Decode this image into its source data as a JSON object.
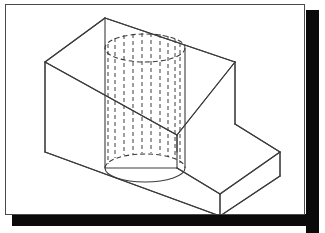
{
  "document": {
    "title": "Isometric stepped block with through hole",
    "figure_type": "engineering-isometric-drawing",
    "background_color": "#ffffff",
    "line_color": "#3c3c3c",
    "shadow_color": "#0a0a0a",
    "frame_border_color": "#4a4a4a"
  },
  "frame": {
    "x": 5,
    "y": 4,
    "width": 300,
    "height": 211,
    "shadow_offset": 13
  },
  "geometry": {
    "description": "Isometric projection of an L-shaped (stepped) rectangular block with a vertical cylindrical through hole. The cylinder is drawn with dashed hidden-line elements and solid visible silhouette edges.",
    "projection": "isometric",
    "solid_edges": [
      {
        "name": "top-face-back-left",
        "x1": 100,
        "y1": 14,
        "x2": 40,
        "y2": 58
      },
      {
        "name": "top-face-back-right",
        "x1": 100,
        "y1": 14,
        "x2": 230,
        "y2": 58
      },
      {
        "name": "top-face-front-left",
        "x1": 40,
        "y1": 58,
        "x2": 172,
        "y2": 131
      },
      {
        "name": "top-face-front-right",
        "x1": 230,
        "y1": 58,
        "x2": 172,
        "y2": 131
      },
      {
        "name": "left-vertical-edge",
        "x1": 40,
        "y1": 58,
        "x2": 40,
        "y2": 148
      },
      {
        "name": "right-vertical-edge",
        "x1": 230,
        "y1": 58,
        "x2": 230,
        "y2": 120
      },
      {
        "name": "front-vertical-edge",
        "x1": 172,
        "y1": 131,
        "x2": 172,
        "y2": 148
      },
      {
        "name": "step-top-right",
        "x1": 230,
        "y1": 120,
        "x2": 275,
        "y2": 148
      },
      {
        "name": "step-top-front",
        "x1": 275,
        "y1": 148,
        "x2": 215,
        "y2": 190
      },
      {
        "name": "step-top-left",
        "x1": 215,
        "y1": 190,
        "x2": 172,
        "y2": 164
      },
      {
        "name": "step-right-vertical",
        "x1": 275,
        "y1": 148,
        "x2": 275,
        "y2": 172
      },
      {
        "name": "step-front-vertical",
        "x1": 215,
        "y1": 190,
        "x2": 215,
        "y2": 212
      },
      {
        "name": "bottom-front-left",
        "x1": 40,
        "y1": 148,
        "x2": 215,
        "y2": 212
      },
      {
        "name": "bottom-front-right",
        "x1": 215,
        "y1": 212,
        "x2": 275,
        "y2": 172
      }
    ],
    "cylinder": {
      "name": "through-hole-cylinder",
      "center_x": 140,
      "top_center_y": 44,
      "bottom_center_y": 164,
      "radius_x": 40,
      "radius_y": 13,
      "top_ellipse_style": "dashed",
      "bottom_ellipse_style": "mixed",
      "silhouette_style": "solid",
      "hidden_generator_count": 11,
      "generator_style": "dashed"
    }
  }
}
